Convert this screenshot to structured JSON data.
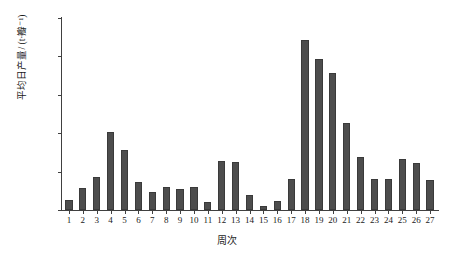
{
  "chart_data": {
    "type": "bar",
    "title": "",
    "xlabel": "周次",
    "ylabel": "平均日产量/ (t·瓣⁻¹)",
    "ylim": [
      0,
      25
    ],
    "yticks": [
      "0.00",
      "5.00",
      "10.00",
      "15.00",
      "20.00",
      "25.00"
    ],
    "ytick_values": [
      0,
      5,
      10,
      15,
      20,
      25
    ],
    "grid": false,
    "legend": "none",
    "bar_color": "#4d4d4d",
    "background_color": "#ffffff",
    "axis_color": "#404040",
    "categories": [
      "1",
      "2",
      "3",
      "4",
      "5",
      "6",
      "7",
      "8",
      "9",
      "10",
      "11",
      "12",
      "13",
      "14",
      "15",
      "16",
      "17",
      "18",
      "19",
      "20",
      "21",
      "22",
      "23",
      "24",
      "25",
      "26",
      "27"
    ],
    "values": [
      1.3,
      2.9,
      4.3,
      10.2,
      7.8,
      3.6,
      2.4,
      3.0,
      2.7,
      3.0,
      1.0,
      6.4,
      6.3,
      1.9,
      0.5,
      1.2,
      4.0,
      22.1,
      19.7,
      17.9,
      11.3,
      6.9,
      4.1,
      4.1,
      6.7,
      6.1,
      3.9
    ]
  }
}
